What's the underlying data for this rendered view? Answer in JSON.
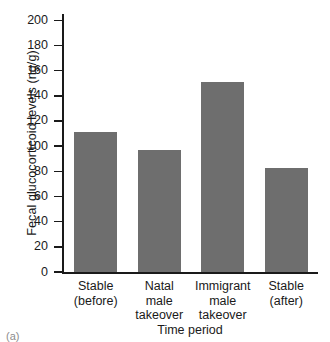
{
  "chart_data": {
    "type": "bar",
    "title": "",
    "xlabel": "Time period",
    "ylabel": "Fecal glucocorticoid levels (ng/g)",
    "categories": [
      "Stable (before)",
      "Natal male takeover",
      "Immigrant male takeover",
      "Stable (after)"
    ],
    "category_lines": [
      [
        "Stable",
        "(before)"
      ],
      [
        "Natal",
        "male",
        "takeover"
      ],
      [
        "Immigrant",
        "male",
        "takeover"
      ],
      [
        "Stable",
        "(after)"
      ]
    ],
    "values": [
      111,
      97,
      151,
      83
    ],
    "ylim": [
      0,
      205
    ],
    "yticks": [
      0,
      20,
      40,
      60,
      80,
      100,
      120,
      140,
      160,
      180,
      200
    ],
    "ytick_labels": [
      "0",
      "20",
      "40",
      "60",
      "80",
      "100",
      "120",
      "140",
      "160",
      "180",
      "200"
    ],
    "grid": false,
    "legend": null,
    "bar_color": "#6e6e6e",
    "axis_color": "#1a1a1a"
  },
  "caption": {
    "panel_label": "(a)"
  }
}
